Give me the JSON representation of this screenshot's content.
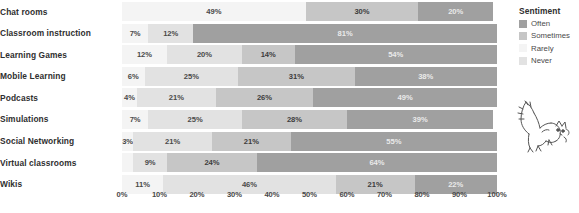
{
  "chart_data": {
    "type": "bar",
    "title": "",
    "xlabel": "",
    "ylabel": "",
    "orientation": "horizontal",
    "stacked": true,
    "normalized_percent": true,
    "xlim": [
      0,
      100
    ],
    "grid": false,
    "legend_position": "right",
    "legend_title": "Sentiment",
    "categories": [
      "Chat rooms",
      "Classroom instruction",
      "Learning Games",
      "Mobile Learning",
      "Podcasts",
      "Simulations",
      "Social Networking",
      "Virtual classrooms",
      "Wikis"
    ],
    "series": [
      {
        "name": "Rarely",
        "values": [
          49,
          7,
          12,
          6,
          4,
          7,
          3,
          3,
          11
        ]
      },
      {
        "name": "Never",
        "values": [
          0,
          12,
          20,
          25,
          21,
          25,
          21,
          9,
          46
        ]
      },
      {
        "name": "Sometimes",
        "values": [
          30,
          0,
          14,
          31,
          26,
          28,
          21,
          24,
          21
        ]
      },
      {
        "name": "Often",
        "values": [
          20,
          81,
          54,
          38,
          49,
          39,
          55,
          64,
          22
        ]
      }
    ],
    "xticks": [
      "0%",
      "10%",
      "20%",
      "30%",
      "40%",
      "50%",
      "60%",
      "70%",
      "80%",
      "90%",
      "100%"
    ]
  },
  "rows": [
    {
      "label": "Chat rooms",
      "segments": [
        {
          "series": "Rarely",
          "value": 49,
          "label": "49%",
          "show_label": true
        },
        {
          "series": "Sometimes",
          "value": 30,
          "label": "30%",
          "show_label": true
        },
        {
          "series": "Often",
          "value": 20,
          "label": "20%",
          "show_label": true
        }
      ]
    },
    {
      "label": "Classroom instruction",
      "segments": [
        {
          "series": "Rarely",
          "value": 7,
          "label": "7%",
          "show_label": true
        },
        {
          "series": "Never",
          "value": 12,
          "label": "12%",
          "show_label": true
        },
        {
          "series": "Often",
          "value": 81,
          "label": "81%",
          "show_label": true
        }
      ]
    },
    {
      "label": "Learning Games",
      "segments": [
        {
          "series": "Rarely",
          "value": 12,
          "label": "12%",
          "show_label": true
        },
        {
          "series": "Never",
          "value": 20,
          "label": "20%",
          "show_label": true
        },
        {
          "series": "Sometimes",
          "value": 14,
          "label": "14%",
          "show_label": true
        },
        {
          "series": "Often",
          "value": 54,
          "label": "54%",
          "show_label": true
        }
      ]
    },
    {
      "label": "Mobile Learning",
      "segments": [
        {
          "series": "Rarely",
          "value": 6,
          "label": "6%",
          "show_label": true
        },
        {
          "series": "Never",
          "value": 25,
          "label": "25%",
          "show_label": true
        },
        {
          "series": "Sometimes",
          "value": 31,
          "label": "31%",
          "show_label": true
        },
        {
          "series": "Often",
          "value": 38,
          "label": "38%",
          "show_label": true
        }
      ]
    },
    {
      "label": "Podcasts",
      "segments": [
        {
          "series": "Rarely",
          "value": 4,
          "label": "4%",
          "show_label": true
        },
        {
          "series": "Never",
          "value": 21,
          "label": "21%",
          "show_label": true
        },
        {
          "series": "Sometimes",
          "value": 26,
          "label": "26%",
          "show_label": true
        },
        {
          "series": "Often",
          "value": 49,
          "label": "49%",
          "show_label": true
        }
      ]
    },
    {
      "label": "Simulations",
      "segments": [
        {
          "series": "Rarely",
          "value": 7,
          "label": "7%",
          "show_label": true
        },
        {
          "series": "Never",
          "value": 25,
          "label": "25%",
          "show_label": true
        },
        {
          "series": "Sometimes",
          "value": 28,
          "label": "28%",
          "show_label": true
        },
        {
          "series": "Often",
          "value": 39,
          "label": "39%",
          "show_label": true
        }
      ]
    },
    {
      "label": "Social Networking",
      "segments": [
        {
          "series": "Rarely",
          "value": 3,
          "label": "3%",
          "show_label": true
        },
        {
          "series": "Never",
          "value": 21,
          "label": "21%",
          "show_label": true
        },
        {
          "series": "Sometimes",
          "value": 21,
          "label": "21%",
          "show_label": true
        },
        {
          "series": "Often",
          "value": 55,
          "label": "55%",
          "show_label": true
        }
      ]
    },
    {
      "label": "Virtual classrooms",
      "segments": [
        {
          "series": "Rarely",
          "value": 3,
          "label": "",
          "show_label": false
        },
        {
          "series": "Never",
          "value": 9,
          "label": "9%",
          "show_label": true
        },
        {
          "series": "Sometimes",
          "value": 24,
          "label": "24%",
          "show_label": true
        },
        {
          "series": "Often",
          "value": 64,
          "label": "64%",
          "show_label": true
        }
      ]
    },
    {
      "label": "Wikis",
      "segments": [
        {
          "series": "Rarely",
          "value": 11,
          "label": "11%",
          "show_label": true
        },
        {
          "series": "Never",
          "value": 46,
          "label": "46%",
          "show_label": true
        },
        {
          "series": "Sometimes",
          "value": 21,
          "label": "21%",
          "show_label": true
        },
        {
          "series": "Often",
          "value": 22,
          "label": "22%",
          "show_label": true
        }
      ]
    }
  ],
  "xaxis": {
    "ticks": [
      "0%",
      "10%",
      "20%",
      "30%",
      "40%",
      "50%",
      "60%",
      "70%",
      "80%",
      "90%",
      "100%"
    ]
  },
  "legend": {
    "title": "Sentiment",
    "items": [
      {
        "label": "Often",
        "color": "#a0a0a0"
      },
      {
        "label": "Sometimes",
        "color": "#c6c6c6"
      },
      {
        "label": "Rarely",
        "color": "#f4f4f4"
      },
      {
        "label": "Never",
        "color": "#e2e2e2"
      }
    ]
  },
  "decoration": {
    "name": "cat-line-drawing"
  },
  "colors": {
    "often": "#a0a0a0",
    "sometimes": "#c6c6c6",
    "rarely": "#f4f4f4",
    "never": "#e2e2e2",
    "text": "#3b3b3b",
    "background": "#ffffff"
  }
}
